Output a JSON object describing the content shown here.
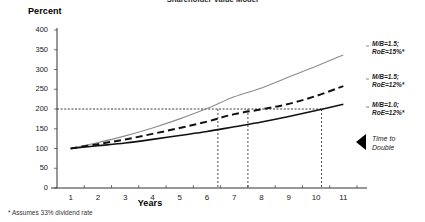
{
  "chart_data": {
    "type": "line",
    "title": "Shareholder Value Model",
    "xlabel": "Years",
    "ylabel": "Percent",
    "xlim": [
      0.5,
      11.5
    ],
    "ylim": [
      0,
      400
    ],
    "ytick_values": [
      0,
      50,
      100,
      150,
      200,
      250,
      300,
      350,
      400
    ],
    "xtick_values": [
      1,
      2,
      3,
      4,
      5,
      6,
      7,
      8,
      9,
      10,
      11
    ],
    "grid": false,
    "legend_position": "right-inline",
    "x": [
      1,
      2,
      3,
      4,
      5,
      6,
      7,
      8,
      9,
      10,
      11
    ],
    "series": [
      {
        "name": "M/B=1.5; RoE=15%*",
        "style": "solid-gray",
        "color": "#8c8c8c",
        "values": [
          100,
          115,
          132,
          152,
          175,
          201,
          231,
          253,
          281,
          308,
          337
        ]
      },
      {
        "name": "M/B=1.5; RoE=12%*",
        "style": "dashed-black",
        "color": "#111111",
        "values": [
          100,
          111,
          123,
          137,
          152,
          168,
          187,
          199,
          213,
          233,
          258
        ]
      },
      {
        "name": "M/B=1.0; RoE=12%*",
        "style": "solid-black",
        "color": "#111111",
        "values": [
          100,
          107,
          114,
          123,
          133,
          143,
          155,
          167,
          181,
          196,
          212
        ]
      }
    ],
    "reference_line": {
      "axis": "y",
      "value": 200,
      "style": "dotted",
      "label": "200"
    },
    "drop_lines": [
      {
        "x": 6.4,
        "series": "M/B=1.5; RoE=15%*",
        "y": 200
      },
      {
        "x": 7.5,
        "series": "M/B=1.5; RoE=12%*",
        "y": 200
      },
      {
        "x": 10.2,
        "series": "M/B=1.0; RoE=12%*",
        "y": 200
      }
    ],
    "annotations": [
      {
        "name": "time-to-double",
        "text_line1": "Time to",
        "text_line2": "Double",
        "marker": "left-triangle"
      }
    ],
    "footnote": "*  Assumes 33% dividend rate"
  },
  "labels": {
    "series_0_line1": "M/B=1.5;",
    "series_0_line2": "RoE=15%*",
    "series_1_line1": "M/B=1.5;",
    "series_1_line2": "RoE=12%*",
    "series_2_line1": "M/B=1.0;",
    "series_2_line2": "RoE=12%*",
    "annot_line1": "Time to",
    "annot_line2": "Double"
  }
}
